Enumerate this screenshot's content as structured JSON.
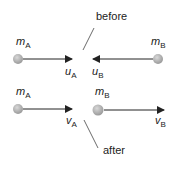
{
  "labels": {
    "before": "before",
    "after": "after",
    "mass_a": "m",
    "mass_b": "m",
    "sub_a": "A",
    "sub_b": "B",
    "u": "u",
    "v": "v"
  },
  "colors": {
    "ball": "#a8a8a8",
    "arrow": "#222222",
    "pointer": "#444444"
  }
}
